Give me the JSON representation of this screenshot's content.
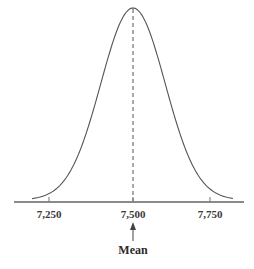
{
  "chart_data": {
    "type": "line",
    "title": "",
    "subtitle": "Normal distribution curve",
    "xlabel": "",
    "ylabel": "",
    "distribution": {
      "kind": "normal",
      "mean": 7500,
      "std_dev_estimate": 100
    },
    "x_ticks": [
      7250,
      7500,
      7750
    ],
    "x_tick_labels": [
      "7,250",
      "7,500",
      "7,750"
    ],
    "xlim": [
      7150,
      7850
    ],
    "grid": false,
    "legend": null,
    "annotations": [
      {
        "type": "dashed-vertical-line",
        "x": 7500,
        "description": "mean line from peak to axis"
      },
      {
        "type": "arrow",
        "x": 7500,
        "label": "Mean"
      }
    ]
  },
  "labels": {
    "tick_1": "7,250",
    "tick_2": "7,500",
    "tick_3": "7,750",
    "mean": "Mean"
  },
  "colors": {
    "curve": "#555555",
    "axis": "#888888",
    "dashed": "#555555",
    "text": "#333333"
  }
}
